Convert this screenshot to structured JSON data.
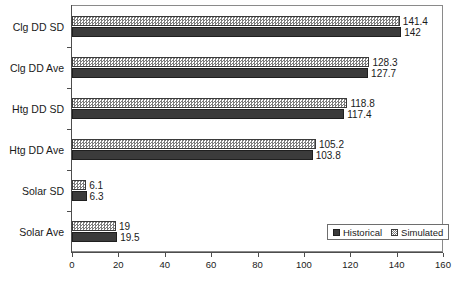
{
  "chart_data": {
    "type": "bar",
    "orientation": "horizontal",
    "title": "",
    "xlabel": "",
    "ylabel": "",
    "xlim": [
      0,
      160
    ],
    "xticks": [
      0,
      20,
      40,
      60,
      80,
      100,
      120,
      140,
      160
    ],
    "grid": false,
    "legend_position": "bottom-right",
    "categories": [
      "Clg DD SD",
      "Clg DD Ave",
      "Htg DD SD",
      "Htg DD Ave",
      "Solar SD",
      "Solar Ave"
    ],
    "series": [
      {
        "name": "Historical",
        "color": "#3b3b3b",
        "pattern": "solid",
        "values": [
          142,
          127.7,
          117.4,
          103.8,
          6.3,
          19.5
        ],
        "labels": [
          "142",
          "127.7",
          "117.4",
          "103.8",
          "6.3",
          "19.5"
        ]
      },
      {
        "name": "Simulated",
        "color": "#7d7d7d",
        "pattern": "checkerboard",
        "values": [
          141.4,
          128.3,
          118.8,
          105.2,
          6.1,
          19
        ],
        "labels": [
          "141.4",
          "128.3",
          "118.8",
          "105.2",
          "6.1",
          "19"
        ]
      }
    ]
  },
  "legend": {
    "entries": [
      {
        "label": "Historical",
        "swatch": "solid-dark-square-icon"
      },
      {
        "label": "Simulated",
        "swatch": "checkered-square-icon"
      }
    ]
  },
  "axis": {
    "x_tick_labels": [
      "0",
      "20",
      "40",
      "60",
      "80",
      "100",
      "120",
      "140",
      "160"
    ]
  }
}
